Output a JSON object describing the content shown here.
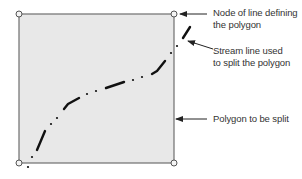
{
  "diagram": {
    "polygon": {
      "fill": "#e8e8e8",
      "stroke": "#6e6e6e",
      "x": 19,
      "y": 14,
      "width": 155,
      "height": 149
    },
    "nodes": [
      {
        "x": 19,
        "y": 14
      },
      {
        "x": 174,
        "y": 14
      },
      {
        "x": 19,
        "y": 163
      },
      {
        "x": 174,
        "y": 163
      }
    ],
    "stream_line": {
      "color": "#111111",
      "dashes": [
        [
          [
            37,
            150
          ],
          [
            45,
            131
          ]
        ],
        [
          [
            64,
            109
          ],
          [
            68,
            104
          ],
          [
            79,
            98
          ]
        ],
        [
          [
            106,
            88
          ],
          [
            124,
            82
          ]
        ],
        [
          [
            152,
            74
          ],
          [
            157,
            71
          ],
          [
            165,
            61
          ]
        ],
        [
          [
            183,
            38
          ],
          [
            190,
            27
          ]
        ]
      ],
      "dots": [
        [
          28,
          167
        ],
        [
          32,
          157
        ],
        [
          51,
          124
        ],
        [
          57,
          118
        ],
        [
          87,
          94
        ],
        [
          96,
          91
        ],
        [
          133,
          80
        ],
        [
          142,
          77
        ],
        [
          171,
          53
        ],
        [
          177,
          46
        ]
      ]
    },
    "annotations": [
      {
        "id": "node",
        "lines": [
          "Node of line defining",
          "the polygon"
        ]
      },
      {
        "id": "stream",
        "lines": [
          "Stream line used",
          "to split the polygon"
        ]
      },
      {
        "id": "polygon",
        "lines": [
          "Polygon to be split"
        ]
      }
    ]
  }
}
